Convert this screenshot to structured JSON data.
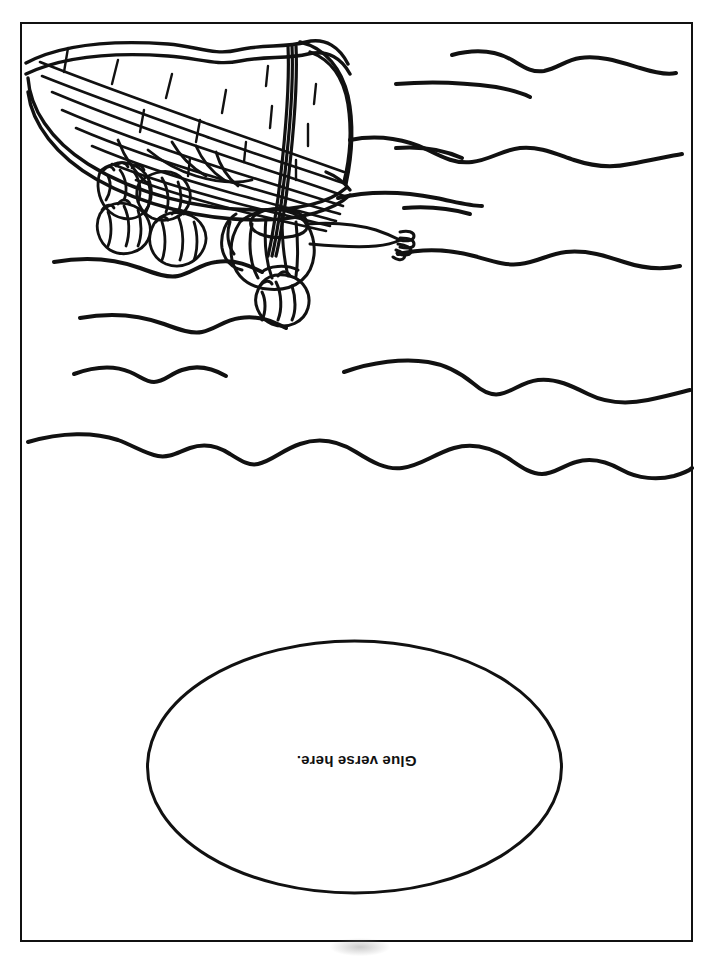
{
  "page": {
    "orientation": "portrait",
    "background_color": "#ffffff",
    "ink_color": "#111111",
    "border": {
      "name": "page-border",
      "style": "solid rectangle",
      "color": "#111111",
      "thickness_px": 2
    }
  },
  "illustration": {
    "name": "boat-in-storm-illustration",
    "description": "Line-art coloring illustration of a wooden boat with a mast, several figures, and one standing figure with an outstretched arm, surrounded by wavy water lines. The artwork is printed upside down (rotated 180 degrees).",
    "rotation_degrees": 180,
    "style": "black outline line art, no fill",
    "elements": [
      "boat-hull",
      "boat-planks",
      "mast",
      "seated-figures",
      "standing-figure",
      "outstretched-arm",
      "water-waves"
    ]
  },
  "verse_area": {
    "name": "glue-verse-ellipse",
    "shape": "ellipse",
    "label": "Glue verse here.",
    "label_rotation_degrees": 180,
    "outline_color": "#111111",
    "fill_color": "#ffffff"
  }
}
